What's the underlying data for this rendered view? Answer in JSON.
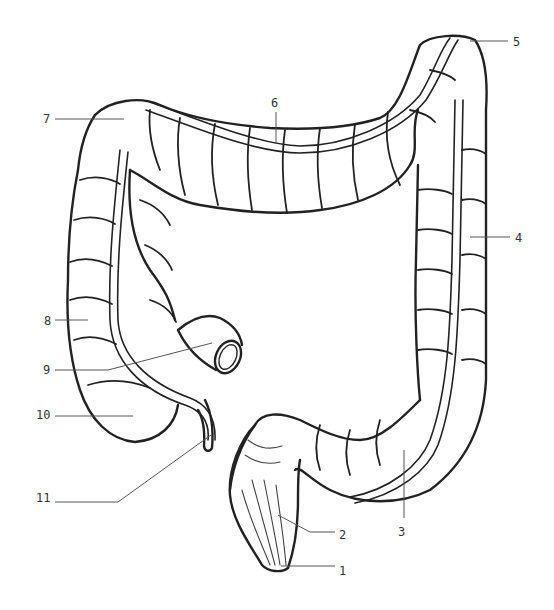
{
  "diagram": {
    "stroke_color": "#222222",
    "leader_color": "#555555",
    "labels": [
      {
        "id": "1",
        "text": "1",
        "x": 339,
        "y": 565,
        "anchor": [
          281,
          566
        ],
        "leader": [
          [
            281,
            566
          ],
          [
            335,
            566
          ]
        ]
      },
      {
        "id": "2",
        "text": "2",
        "x": 339,
        "y": 529,
        "anchor": [
          278,
          515
        ],
        "leader": [
          [
            278,
            515
          ],
          [
            310,
            532
          ],
          [
            335,
            532
          ]
        ]
      },
      {
        "id": "3",
        "text": "3",
        "x": 398,
        "y": 526,
        "anchor": [
          404,
          450
        ],
        "leader": [
          [
            404,
            450
          ],
          [
            404,
            518
          ]
        ]
      },
      {
        "id": "4",
        "text": "4",
        "x": 515,
        "y": 232,
        "anchor": [
          470,
          237
        ],
        "leader": [
          [
            470,
            237
          ],
          [
            510,
            237
          ]
        ]
      },
      {
        "id": "5",
        "text": "5",
        "x": 513,
        "y": 36,
        "anchor": [
          470,
          41
        ],
        "leader": [
          [
            470,
            41
          ],
          [
            508,
            41
          ]
        ]
      },
      {
        "id": "6",
        "text": "6",
        "x": 271,
        "y": 97,
        "anchor": [
          276,
          143
        ],
        "leader": [
          [
            276,
            112
          ],
          [
            276,
            143
          ]
        ]
      },
      {
        "id": "7",
        "text": "7",
        "x": 43,
        "y": 113,
        "anchor": [
          124,
          119
        ],
        "leader": [
          [
            55,
            119
          ],
          [
            124,
            119
          ]
        ]
      },
      {
        "id": "8",
        "text": "8",
        "x": 44,
        "y": 315,
        "anchor": [
          88,
          320
        ],
        "leader": [
          [
            55,
            320
          ],
          [
            88,
            320
          ]
        ]
      },
      {
        "id": "9",
        "text": "9",
        "x": 43,
        "y": 364,
        "anchor": [
          212,
          343
        ],
        "leader": [
          [
            55,
            370
          ],
          [
            108,
            370
          ],
          [
            212,
            343
          ]
        ]
      },
      {
        "id": "10",
        "text": "10",
        "x": 36,
        "y": 409,
        "anchor": [
          133,
          416
        ],
        "leader": [
          [
            55,
            416
          ],
          [
            133,
            416
          ]
        ]
      },
      {
        "id": "11",
        "text": "11",
        "x": 36,
        "y": 492,
        "anchor": [
          211,
          435
        ],
        "leader": [
          [
            55,
            502
          ],
          [
            118,
            502
          ],
          [
            211,
            435
          ]
        ]
      }
    ]
  }
}
